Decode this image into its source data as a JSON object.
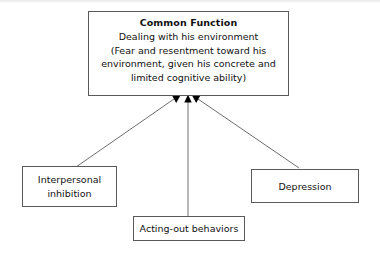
{
  "diagram": {
    "type": "convergence-flow-diagram",
    "title_node": {
      "id": "common-function",
      "heading": "Common Function",
      "lines": [
        "Dealing with his environment",
        "(Fear and resentment toward his",
        "environment, given his concrete and",
        "limited cognitive ability)"
      ]
    },
    "source_nodes": [
      {
        "id": "interpersonal-inhibition",
        "lines": [
          "Interpersonal",
          "inhibition"
        ]
      },
      {
        "id": "acting-out-behaviors",
        "lines": [
          "Acting-out behaviors"
        ]
      },
      {
        "id": "depression",
        "lines": [
          "Depression"
        ]
      }
    ],
    "edges": [
      {
        "id": "edge-interpersonal-to-common",
        "from": "interpersonal-inhibition",
        "to": "common-function",
        "arrowhead": "filled-triangle"
      },
      {
        "id": "edge-acting-out-to-common",
        "from": "acting-out-behaviors",
        "to": "common-function",
        "arrowhead": "filled-triangle"
      },
      {
        "id": "edge-depression-to-common",
        "from": "depression",
        "to": "common-function",
        "arrowhead": "filled-triangle"
      }
    ],
    "colors": {
      "background": "#ffffff",
      "box_border": "#5a5a5a",
      "text": "#111111",
      "edge_line": "#6e6e6e",
      "arrowhead": "#000000"
    }
  }
}
